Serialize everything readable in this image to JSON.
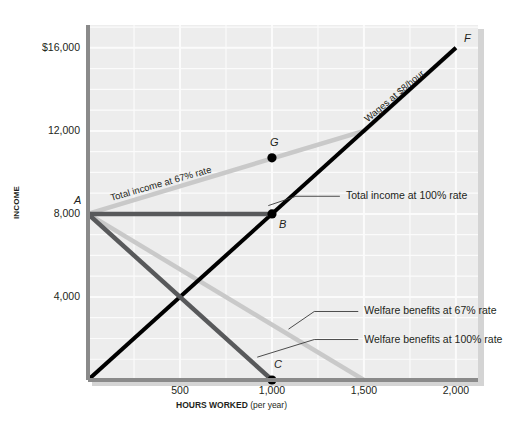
{
  "chart_data": {
    "type": "line",
    "title": "",
    "xlabel_bold": "HOURS WORKED",
    "xlabel_sub": "(per year)",
    "ylabel": "INCOME",
    "xlim": [
      0,
      2120
    ],
    "ylim": [
      0,
      17100
    ],
    "xticks": [
      500,
      1000,
      1500,
      2000
    ],
    "xticklabels": [
      "500",
      "1,000",
      "1,500",
      "2,000"
    ],
    "yticks": [
      4000,
      8000,
      12000,
      16000
    ],
    "yticklabels": [
      "4,000",
      "8,000",
      "12,000",
      "$16,000"
    ],
    "grid": true,
    "grid_x_step": 250,
    "grid_y_step": 1000,
    "legend_position": "inline-callouts",
    "series": [
      {
        "name": "Wages at $8/hour",
        "color": "#000000",
        "width": 4.0,
        "x": [
          0,
          2000
        ],
        "y": [
          0,
          16000
        ],
        "label_inline": "Wages at $8/hour",
        "label_x": 1530,
        "label_y": 12850,
        "label_rotation": -40
      },
      {
        "name": "Total income at 67% rate",
        "color": "#c9c9c9",
        "width": 4.5,
        "x": [
          0,
          1500,
          2000
        ],
        "y": [
          8000,
          12000,
          16000
        ],
        "label_inline": "Total income at 67% rate",
        "label_x": 130,
        "label_y": 9050,
        "label_rotation": -16
      },
      {
        "name": "Total income at 100% rate",
        "color": "#58595b",
        "width": 4.5,
        "x": [
          0,
          1000
        ],
        "y": [
          8000,
          8000
        ],
        "callout_label": "Total income at 100% rate",
        "callout_from_x": 980,
        "callout_from_y": 8400,
        "callout_to_x": 1130,
        "callout_to_y": 8850
      },
      {
        "name": "Welfare benefits at 67% rate",
        "color": "#c9c9c9",
        "width": 4.5,
        "x": [
          0,
          1500
        ],
        "y": [
          8000,
          0
        ],
        "callout_label": "Welfare benefits at 67% rate",
        "callout_from_x": 1090,
        "callout_from_y": 2450,
        "callout_to_x": 1230,
        "callout_to_y": 3300
      },
      {
        "name": "Welfare benefits at 100% rate",
        "color": "#58595b",
        "width": 4.5,
        "x": [
          0,
          1000
        ],
        "y": [
          8000,
          0
        ],
        "callout_label": "Welfare benefits at 100% rate",
        "callout_from_x": 920,
        "callout_from_y": 1100,
        "callout_to_x": 1230,
        "callout_to_y": 1950
      }
    ],
    "points": [
      {
        "name": "A",
        "x": 0,
        "y": 8000,
        "label": "A",
        "marker": false,
        "label_dx": -14,
        "label_dy": -20
      },
      {
        "name": "B",
        "x": 1000,
        "y": 8000,
        "label": "B",
        "marker": true,
        "label_dx": 7,
        "label_dy": 4
      },
      {
        "name": "C",
        "x": 1000,
        "y": 0,
        "label": "C",
        "marker": true,
        "label_dx": 2,
        "label_dy": -22
      },
      {
        "name": "G",
        "x": 1000,
        "y": 10700,
        "label": "G",
        "marker": true,
        "label_dx": -2,
        "label_dy": -22
      },
      {
        "name": "F",
        "x": 2000,
        "y": 16000,
        "label": "F",
        "marker": false,
        "label_dx": 8,
        "label_dy": -16
      }
    ]
  }
}
